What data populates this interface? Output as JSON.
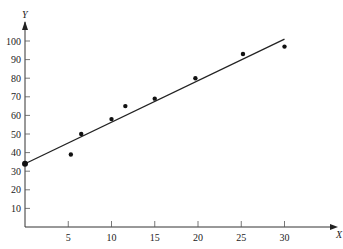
{
  "chart_data": {
    "type": "scatter",
    "title": "",
    "xlabel": "X",
    "ylabel": "Y",
    "xlim": [
      0,
      32
    ],
    "ylim": [
      0,
      105
    ],
    "x_ticks": [
      5,
      10,
      15,
      20,
      25,
      30
    ],
    "y_ticks": [
      10,
      20,
      30,
      40,
      50,
      60,
      70,
      80,
      90,
      100
    ],
    "grid": false,
    "legend": null,
    "series": [
      {
        "name": "observations",
        "x": [
          0,
          5.3,
          6.5,
          10,
          11.6,
          15,
          19.7,
          25.2,
          30
        ],
        "y": [
          34,
          39,
          50,
          58,
          65,
          69,
          80,
          93,
          97
        ]
      }
    ],
    "fit_line": {
      "x": [
        0,
        30
      ],
      "y": [
        34,
        101
      ]
    }
  }
}
